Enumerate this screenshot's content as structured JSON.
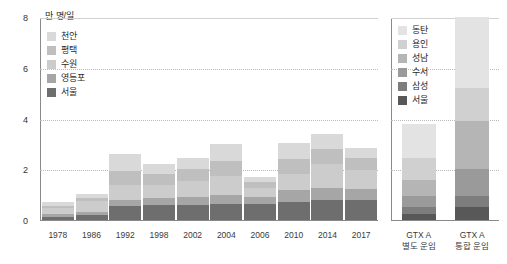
{
  "unit_label": "만 명/일",
  "axis": {
    "y_ticks": [
      "8",
      "6",
      "4",
      "2",
      "0"
    ],
    "y_min": 0,
    "y_max": 8
  },
  "legend_history": {
    "items": [
      {
        "label": "천안",
        "color": "#d9d9d9"
      },
      {
        "label": "평택",
        "color": "#bfbfbf"
      },
      {
        "label": "수원",
        "color": "#cccccc"
      },
      {
        "label": "영등포",
        "color": "#a6a6a6"
      },
      {
        "label": "서울",
        "color": "#6e6e6e"
      }
    ]
  },
  "legend_gtx": {
    "items": [
      {
        "label": "동탄",
        "color": "#e3e3e3"
      },
      {
        "label": "용인",
        "color": "#d0d0d0"
      },
      {
        "label": "성남",
        "color": "#b5b5b5"
      },
      {
        "label": "수서",
        "color": "#9a9a9a"
      },
      {
        "label": "삼성",
        "color": "#7d7d7d"
      },
      {
        "label": "서울",
        "color": "#585858"
      }
    ]
  },
  "gtx_labels": [
    {
      "line1": "GTX A",
      "line2": "별도 운임"
    },
    {
      "line1": "GTX A",
      "line2": "통합 운임"
    }
  ],
  "chart_data": {
    "type": "bar",
    "title": "",
    "subtitle": "",
    "xlabel": "",
    "ylabel": "만 명/일",
    "ylim": [
      0,
      8
    ],
    "yticks": [
      0,
      2,
      4,
      6,
      8
    ],
    "grid": true,
    "stacked": true,
    "legend_position": "inside-top-left and inside-top-right",
    "panels": [
      {
        "name": "history",
        "categories": [
          "1978",
          "1986",
          "1992",
          "1998",
          "2002",
          "2004",
          "2006",
          "2010",
          "2014",
          "2017"
        ],
        "series": [
          {
            "name": "서울",
            "color": "#6e6e6e",
            "values": [
              0.12,
              0.18,
              0.55,
              0.58,
              0.6,
              0.62,
              0.62,
              0.72,
              0.78,
              0.8
            ]
          },
          {
            "name": "영등포",
            "color": "#a6a6a6",
            "values": [
              0.12,
              0.14,
              0.22,
              0.3,
              0.32,
              0.38,
              0.3,
              0.46,
              0.5,
              0.42
            ]
          },
          {
            "name": "수원",
            "color": "#cccccc",
            "values": [
              0.22,
              0.42,
              0.62,
              0.5,
              0.6,
              0.72,
              0.36,
              0.62,
              0.92,
              0.76
            ]
          },
          {
            "name": "평택",
            "color": "#bfbfbf",
            "values": [
              0.1,
              0.12,
              0.55,
              0.42,
              0.5,
              0.62,
              0.22,
              0.62,
              0.58,
              0.45
            ]
          },
          {
            "name": "천안",
            "color": "#d9d9d9",
            "values": [
              0.14,
              0.18,
              0.66,
              0.4,
              0.42,
              0.66,
              0.2,
              0.62,
              0.62,
              0.42
            ]
          }
        ],
        "totals": [
          0.7,
          1.04,
          2.6,
          2.2,
          2.44,
          3.0,
          1.7,
          3.04,
          3.4,
          2.85
        ]
      },
      {
        "name": "gtx",
        "categories": [
          "GTX A 별도 운임",
          "GTX A 통합 운임"
        ],
        "series": [
          {
            "name": "서울",
            "color": "#585858",
            "values": [
              0.22,
              0.52
            ]
          },
          {
            "name": "삼성",
            "color": "#7d7d7d",
            "values": [
              0.28,
              0.42
            ]
          },
          {
            "name": "수서",
            "color": "#9a9a9a",
            "values": [
              0.45,
              1.06
            ]
          },
          {
            "name": "성남",
            "color": "#b5b5b5",
            "values": [
              0.62,
              1.9
            ]
          },
          {
            "name": "용인",
            "color": "#d0d0d0",
            "values": [
              0.88,
              1.3
            ]
          },
          {
            "name": "동탄",
            "color": "#e3e3e3",
            "values": [
              1.35,
              2.8
            ]
          }
        ],
        "totals": [
          3.8,
          8.0
        ]
      }
    ]
  }
}
